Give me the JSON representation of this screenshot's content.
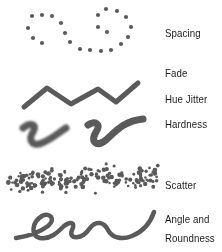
{
  "labels": {
    "spacing": "Spacing",
    "fade": "Fade",
    "hue_jitter": "Hue Jitter",
    "hardness": "Hardness",
    "scatter": "Scatter",
    "angle_line1": "Angle and",
    "angle_line2": "Roundness"
  },
  "colors": {
    "stroke": "#5a5a5a",
    "text": "#1a1a1a",
    "background": "#ffffff"
  },
  "samples": [
    {
      "name": "spacing",
      "icon": "dotted-loop-stroke"
    },
    {
      "name": "fade",
      "icon": "fading-line-stroke"
    },
    {
      "name": "hue-jitter",
      "icon": "zigzag-stroke"
    },
    {
      "name": "hardness",
      "icon": "soft-and-hard-curve-strokes"
    },
    {
      "name": "scatter",
      "icon": "scattered-dots-stroke"
    },
    {
      "name": "angle-roundness",
      "icon": "calligraphic-loop-stroke"
    }
  ]
}
